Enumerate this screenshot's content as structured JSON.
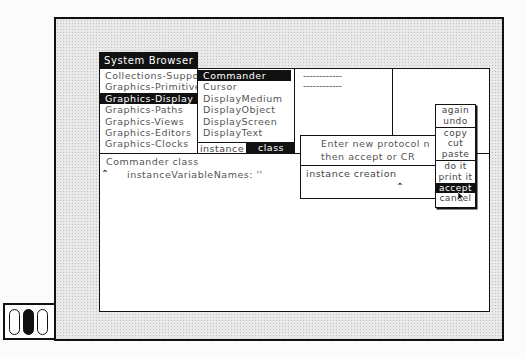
{
  "window": {
    "title": "System Browser"
  },
  "panes": {
    "categories": {
      "items": [
        {
          "label": "Collections-Suppo",
          "selected": false
        },
        {
          "label": "Graphics-Primitive",
          "selected": false
        },
        {
          "label": "Graphics-Display",
          "selected": true
        },
        {
          "label": "Graphics-Paths",
          "selected": false
        },
        {
          "label": "Graphics-Views",
          "selected": false
        },
        {
          "label": "Graphics-Editors",
          "selected": false
        },
        {
          "label": "Graphics-Clocks",
          "selected": false
        }
      ]
    },
    "classes": {
      "items": [
        {
          "label": "Commander",
          "selected": true
        },
        {
          "label": "Cursor",
          "selected": false
        },
        {
          "label": "DisplayMedium",
          "selected": false
        },
        {
          "label": "DisplayObject",
          "selected": false
        },
        {
          "label": "DisplayScreen",
          "selected": false
        },
        {
          "label": "DisplayText",
          "selected": false
        }
      ],
      "switch": {
        "instance_label": "instance",
        "class_label": "class",
        "selected": "class"
      }
    },
    "protocols": {
      "items": [
        "------------",
        "------------"
      ]
    },
    "methods": {
      "items": []
    },
    "code": {
      "lines": [
        "Commander class",
        "instanceVariableNames: ''"
      ]
    }
  },
  "prompt": {
    "message_line1": "Enter new protocol n",
    "message_line2": "then accept or CR",
    "input_value": "instance creation"
  },
  "popup_menu": {
    "items": [
      {
        "label": "again",
        "selected": false,
        "separator_before": false
      },
      {
        "label": "undo",
        "selected": false,
        "separator_before": false
      },
      {
        "label": "copy",
        "selected": false,
        "separator_before": true
      },
      {
        "label": "cut",
        "selected": false,
        "separator_before": false
      },
      {
        "label": "paste",
        "selected": false,
        "separator_before": false
      },
      {
        "label": "do it",
        "selected": false,
        "separator_before": true
      },
      {
        "label": "print it",
        "selected": false,
        "separator_before": false
      },
      {
        "label": "accept",
        "selected": true,
        "separator_before": false
      },
      {
        "label": "cancel",
        "selected": false,
        "separator_before": false
      }
    ]
  },
  "mouse_indicator": {
    "buttons": [
      {
        "name": "red",
        "pressed": false
      },
      {
        "name": "yellow",
        "pressed": true
      },
      {
        "name": "blue",
        "pressed": false
      }
    ]
  },
  "colors": {
    "foreground": "#111111",
    "background": "#ffffff",
    "desktop_pattern": "#e9e9e9"
  }
}
